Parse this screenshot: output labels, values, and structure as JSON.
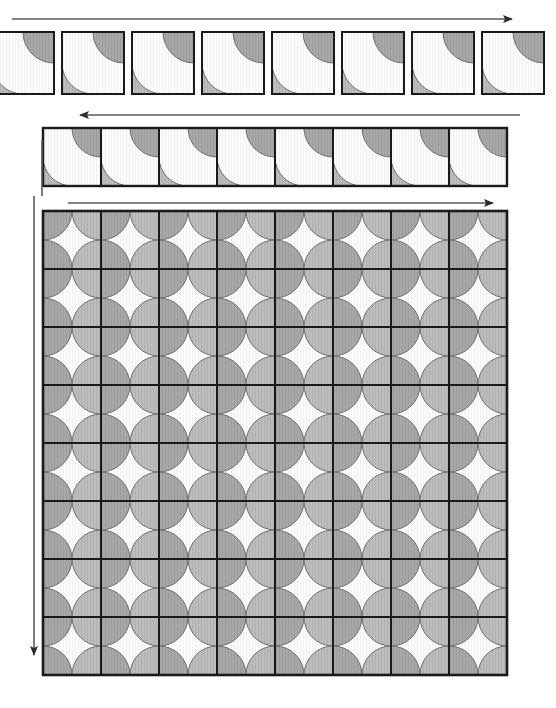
{
  "figure": {
    "width": 556,
    "height": 708,
    "background_color": "#ffffff"
  },
  "colors": {
    "tile_outline": "#1a1a1a",
    "grid_line": "#1a1a1a",
    "cell_fill_light": "#fafafa",
    "cell_fill_stripe": "#f2f2f2",
    "disc_fill_light": "#b8b8b8",
    "disc_fill_dark": "#9a9a9a",
    "disc_outline": "#6e6e6e",
    "arrow_color": "#4d4d4d",
    "rule_color": "#666666"
  },
  "stages": [
    {
      "name": "separated-tiles-strip",
      "label": "row-1",
      "tile_count": 8,
      "tile_size": 62,
      "gap": 8,
      "x_start": -8,
      "y": 32,
      "motif": "quarter-circles at top-right and bottom-left corners",
      "clipped_left": true
    },
    {
      "name": "joined-tiles-strip",
      "label": "row-2",
      "tile_count": 8,
      "tile_size": 58,
      "gap": 0,
      "x_start": 43,
      "y": 128,
      "motif": "adjacent quarter-circles merge into half-circles along shared edges"
    },
    {
      "name": "tiled-grid",
      "label": "main-grid",
      "columns": 8,
      "rows": 8,
      "cell_size": 58,
      "x_start": 43,
      "y": 211,
      "motif": "quarter-circles at every corner merge into full circles at interior vertices"
    }
  ],
  "arrows": [
    {
      "name": "arrow-top-right",
      "direction": "right",
      "x1": 12,
      "y1": 19,
      "x2": 521,
      "y2": 19
    },
    {
      "name": "arrow-second-left",
      "direction": "left",
      "x1": 520,
      "y1": 115,
      "x2": 71,
      "y2": 115
    },
    {
      "name": "arrow-second-vertical-rule",
      "direction": "none",
      "x1": 42,
      "y1": 140,
      "x2": 42,
      "y2": 196
    },
    {
      "name": "arrow-main-right",
      "direction": "right",
      "x1": 68,
      "y1": 203,
      "x2": 502,
      "y2": 203
    },
    {
      "name": "arrow-main-down",
      "direction": "down",
      "x1": 34,
      "y1": 196,
      "x2": 34,
      "y2": 664
    }
  ]
}
